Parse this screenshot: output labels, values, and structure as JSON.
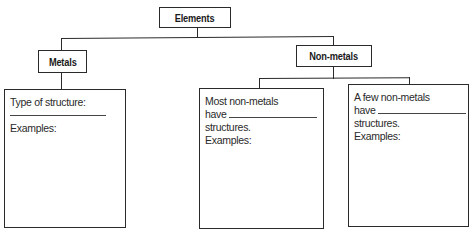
{
  "diagram": {
    "root": {
      "label": "Elements"
    },
    "branches": [
      {
        "label": "Metals",
        "children": [
          {
            "lines": [
              "Type of structure:",
              "Examples:"
            ],
            "blank_after_first": true
          }
        ]
      },
      {
        "label": "Non-metals",
        "children": [
          {
            "line1": "Most non-metals",
            "line2_prefix": "have",
            "line3": "structures.",
            "line4": "Examples:"
          },
          {
            "line1": "A few non-metals",
            "line2_prefix": "have",
            "line3": "structures.",
            "line4": "Examples:"
          }
        ]
      }
    ]
  }
}
